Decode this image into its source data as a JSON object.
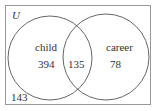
{
  "diagram": {
    "type": "venn",
    "universe_label": "U",
    "sets": [
      {
        "name": "child",
        "only_count": "394"
      },
      {
        "name": "career",
        "only_count": "78"
      }
    ],
    "intersection_count": "135",
    "outside_count": "143"
  }
}
